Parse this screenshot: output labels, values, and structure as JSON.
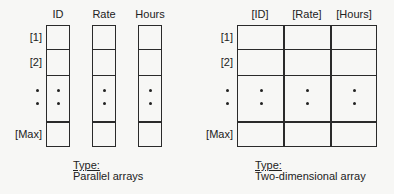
{
  "parallel": {
    "columns": [
      "ID",
      "Rate",
      "Hours"
    ],
    "rows": [
      "[1]",
      "[2]",
      "[Max]"
    ],
    "type_label": "Type:",
    "type_value": "Parallel arrays"
  },
  "twod": {
    "columns": [
      "[ID]",
      "[Rate]",
      "[Hours]"
    ],
    "rows": [
      "[1]",
      "[2]",
      "[Max]"
    ],
    "type_label": "Type:",
    "type_value": "Two-dimensional array"
  },
  "colors": {
    "line": "#2a2a2a",
    "background": "#f7f7f5"
  }
}
